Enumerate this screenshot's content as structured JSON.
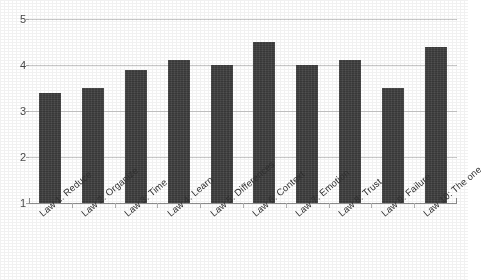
{
  "chart_data": {
    "type": "bar",
    "title": "",
    "subtitle": "",
    "xlabel": "",
    "ylabel": "",
    "ylim": [
      1,
      5
    ],
    "yticks": [
      "1",
      "2",
      "3",
      "4",
      "5"
    ],
    "grid": true,
    "legend": false,
    "legend_position": "none",
    "bar_color": "#3f3f3f",
    "gridline_color": "#c9c9c9",
    "axis_color": "#8d8d8d",
    "background_color": "#ffffff",
    "categories": [
      "Law 1: Reduce",
      "Law 2: Organize",
      "Law 3: Time",
      "Law 4: Learn",
      "Law 5: Differences",
      "Law 6: Context",
      "Law 7: Emotion",
      "Law 8: Trust",
      "Law 9: Failure",
      "Law 10: The one"
    ],
    "values": [
      3.4,
      3.5,
      3.9,
      4.1,
      4.0,
      4.5,
      4.0,
      4.1,
      3.5,
      4.4
    ],
    "series": [
      {
        "name": "Average rating",
        "values": [
          3.4,
          3.5,
          3.9,
          4.1,
          4.0,
          4.5,
          4.0,
          4.1,
          3.5,
          4.4
        ]
      }
    ]
  }
}
